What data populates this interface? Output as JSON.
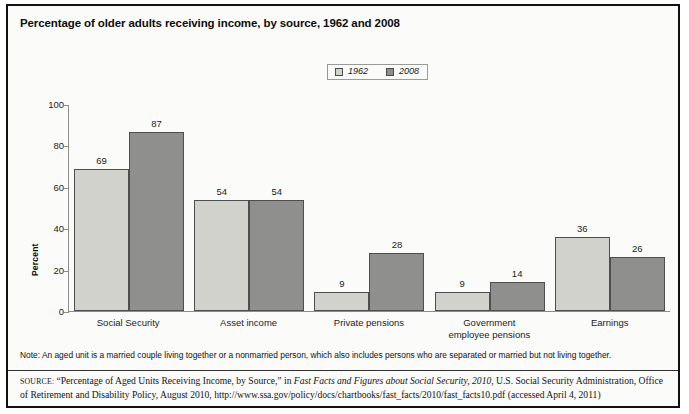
{
  "figure": {
    "title": "Percentage of older adults receiving income, by source, 1962 and 2008",
    "note": "Note: An aged unit is a married couple living together or a nonmarried person, which also includes persons who are separated or married but not living together.",
    "source": {
      "label": "SOURCE:",
      "part1": "“Percentage of Aged Units Receiving Income, by Source,” in ",
      "italic1": "Fast Facts and Figures about Social Security, 2010",
      "part2": ", U.S. Social Security Administration, Office of Retirement and Disability Policy, August 2010, http://www.ssa.gov/policy/docs/chartbooks/fast_facts/2010/fast_facts10.pdf (accessed April 4, 2011)"
    }
  },
  "legend": {
    "entries": [
      {
        "label": "1962",
        "color": "#d2d2cd"
      },
      {
        "label": "2008",
        "color": "#8f8f8d"
      }
    ]
  },
  "axes": {
    "y_title": "Percent",
    "y_ticks": [
      "100",
      "80",
      "60",
      "40",
      "20",
      "0"
    ]
  },
  "chart_data": {
    "type": "bar",
    "title": "Percentage of older adults receiving income, by source, 1962 and 2008",
    "xlabel": "",
    "ylabel": "Percent",
    "ylim": [
      0,
      100
    ],
    "ytick_step": 20,
    "grid": false,
    "legend_position": "top-center",
    "categories": [
      "Social Security",
      "Asset income",
      "Private pensions",
      "Government\nemployee pensions",
      "Earnings"
    ],
    "series": [
      {
        "name": "1962",
        "color": "#d2d2cd",
        "values": [
          69,
          54,
          9,
          9,
          36
        ]
      },
      {
        "name": "2008",
        "color": "#8f8f8d",
        "values": [
          87,
          54,
          28,
          14,
          26
        ]
      }
    ]
  }
}
